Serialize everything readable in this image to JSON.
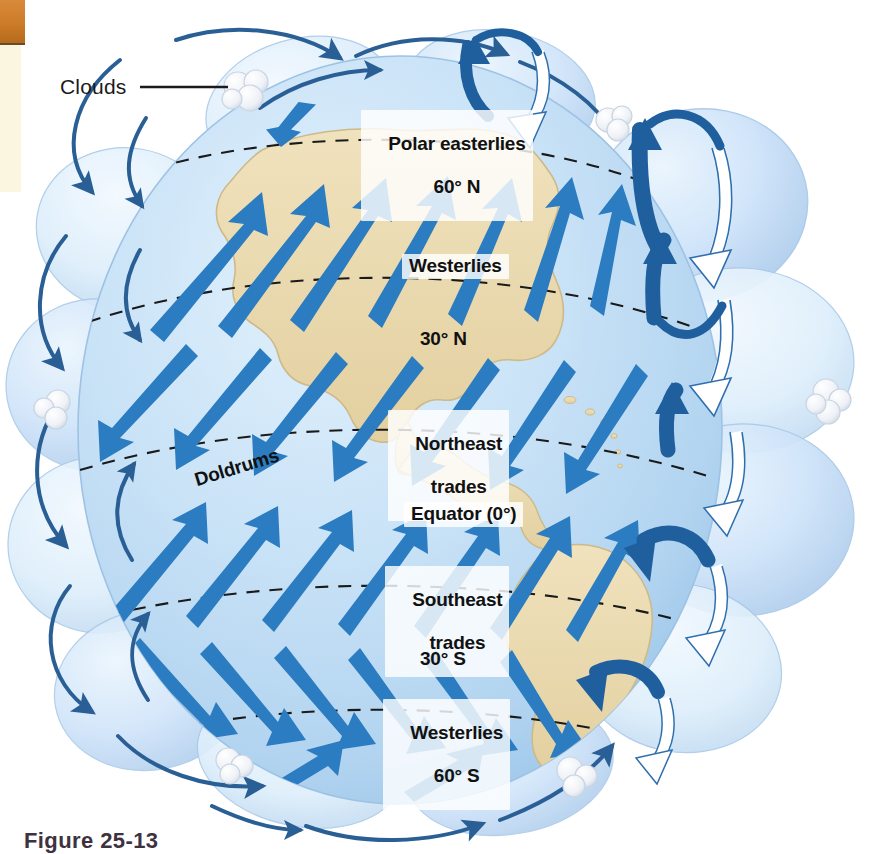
{
  "figure": {
    "domain": "diagram",
    "caption": "Figure 25-13",
    "caption_visible_partial": true
  },
  "callouts": [
    {
      "id": "clouds",
      "label": "Clouds",
      "leader": true
    }
  ],
  "wind_belts": [
    {
      "id": "polar-easterlies-n",
      "line1": "Polar easterlies",
      "line2": "60° N",
      "boxed": true
    },
    {
      "id": "westerlies-n",
      "line1": "Westerlies",
      "line2": "",
      "boxed": true
    },
    {
      "id": "latitude-30n",
      "line1": "30° N",
      "line2": "",
      "boxed": false
    },
    {
      "id": "northeast-trades",
      "line1": "Northeast",
      "line2": "trades",
      "boxed": true
    },
    {
      "id": "doldrums",
      "line1": "Doldrums",
      "line2": "",
      "boxed": false
    },
    {
      "id": "equator",
      "line1": "Equator (0°)",
      "line2": "",
      "boxed": true
    },
    {
      "id": "southeast-trades",
      "line1": "Southeast",
      "line2": "trades",
      "boxed": true
    },
    {
      "id": "latitude-30s",
      "line1": "30° S",
      "line2": "",
      "boxed": false
    },
    {
      "id": "westerlies-s",
      "line1": "Westerlies",
      "line2": "60° S",
      "boxed": true
    }
  ],
  "labels": {
    "clouds": "Clouds",
    "polar_easterlies_l1": "Polar easterlies",
    "polar_easterlies_l2": "60° N",
    "westerlies_n": "Westerlies",
    "lat_30n": "30° N",
    "ne_trades_l1": "Northeast",
    "ne_trades_l2": "trades",
    "doldrums": "Doldrums",
    "equator": "Equator (0°)",
    "se_trades_l1": "Southeast",
    "se_trades_l2": "trades",
    "lat_30s": "30° S",
    "westerlies_s_l1": "Westerlies",
    "westerlies_s_l2": "60° S",
    "caption": "Figure 25-13"
  },
  "latitude_lines": [
    {
      "name": "60° N",
      "style": "dashed"
    },
    {
      "name": "30° N",
      "style": "dashed"
    },
    {
      "name": "Equator (0°)",
      "style": "dashed"
    },
    {
      "name": "30° S",
      "style": "dashed"
    },
    {
      "name": "60° S",
      "style": "dashed"
    }
  ],
  "circulation_cells": {
    "description": "Side-view convection cell lobes shown around the globe limb",
    "cells": [
      "polar cell (north)",
      "Ferrel cell (north)",
      "Hadley cell (north)",
      "Hadley cell (south)",
      "Ferrel cell (south)",
      "polar cell (south)"
    ]
  },
  "colors": {
    "ocean": "#bedcf3",
    "ocean_light": "#d8ecfa",
    "land": "#ead9ad",
    "land_edge": "#cdb98a",
    "arrow_blue": "#2b7cc0",
    "arrow_blue_dark": "#1f5f9e",
    "thin_arrow": "#2a5f96",
    "lobe_fill": "#c5defa",
    "lobe_fill_light": "#dcecfb",
    "lobe_edge": "#a9c9e8",
    "white_arrow_fill": "#ffffff",
    "white_arrow_edge": "#2f6fae",
    "cloud": "#f0f2f6",
    "cloud_edge": "#c9d4e2",
    "dash_line": "#1a1a1a",
    "text": "#111111",
    "caption_text": "#3e3240",
    "swatch_orange": "#d2822d",
    "swatch_cream": "#faf6df",
    "background": "#ffffff"
  },
  "swatches": [
    {
      "name": "orange-block",
      "color": "#d2822d"
    },
    {
      "name": "cream-strip",
      "color": "#faf6df"
    }
  ]
}
